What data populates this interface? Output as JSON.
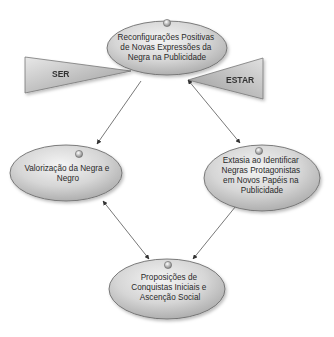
{
  "colors": {
    "ellipse_fill_light": "#f2f2f2",
    "ellipse_fill_dark": "#b4b4b4",
    "ellipse_stroke": "#6e6e6e",
    "triangle_fill_light": "#e6e6e6",
    "triangle_fill_dark": "#9c9c9c",
    "arrow": "#555555",
    "text": "#2a2a2a"
  },
  "nodes": {
    "top": {
      "lines": [
        "Reconfigurações Positivas",
        "de Novas Expressões da",
        "Negra na Publicidade"
      ]
    },
    "left": {
      "lines": [
        "Valorização da Negra e",
        "Negro"
      ]
    },
    "right": {
      "lines": [
        "Extasia ao Identificar",
        "Negras Protagonistas",
        "em Novos Papéis na",
        "Publicidade"
      ]
    },
    "bottom": {
      "lines": [
        "Proposições de",
        "Conquistas Iniciais e",
        "Ascenção Social"
      ]
    }
  },
  "triangles": {
    "left": {
      "label": "SER"
    },
    "right": {
      "label": "ESTAR"
    }
  },
  "edges": [
    {
      "from": "top",
      "to": "left",
      "direction": "one-way"
    },
    {
      "from": "top",
      "to": "right",
      "direction": "bidirectional"
    },
    {
      "from": "left",
      "to": "bottom",
      "direction": "bidirectional"
    },
    {
      "from": "right",
      "to": "bottom",
      "direction": "bidirectional"
    }
  ]
}
